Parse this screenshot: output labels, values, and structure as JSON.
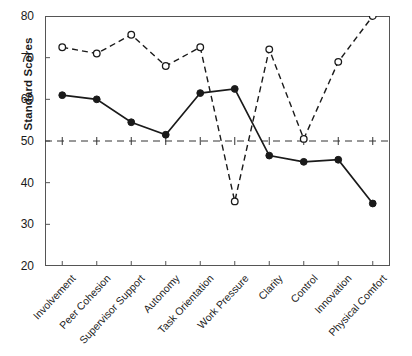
{
  "chart_data": {
    "type": "line",
    "title": "",
    "xlabel": "",
    "ylabel": "Standard Scores",
    "categories": [
      "Involvement",
      "Peer Cohesion",
      "Supervisor Support",
      "Autonomy",
      "Task Orientation",
      "Work Pressure",
      "Clarity",
      "Control",
      "Innovation",
      "Physical Comfort"
    ],
    "ylim": [
      20,
      80
    ],
    "yticks": [
      20,
      30,
      40,
      50,
      60,
      70,
      80
    ],
    "grid": false,
    "reference_line": 50,
    "legend": "none",
    "series": [
      {
        "name": "open-circle-dashed",
        "marker": "open-circle",
        "linestyle": "dashed",
        "color": "#1a1a1a",
        "values": [
          72.5,
          71,
          75.5,
          68,
          72.5,
          35.5,
          72,
          50.5,
          69,
          80
        ]
      },
      {
        "name": "filled-circle-solid",
        "marker": "filled-circle",
        "linestyle": "solid",
        "color": "#1a1a1a",
        "values": [
          61,
          60,
          54.5,
          51.5,
          61.5,
          62.5,
          46.5,
          45,
          45.5,
          35
        ]
      }
    ]
  }
}
